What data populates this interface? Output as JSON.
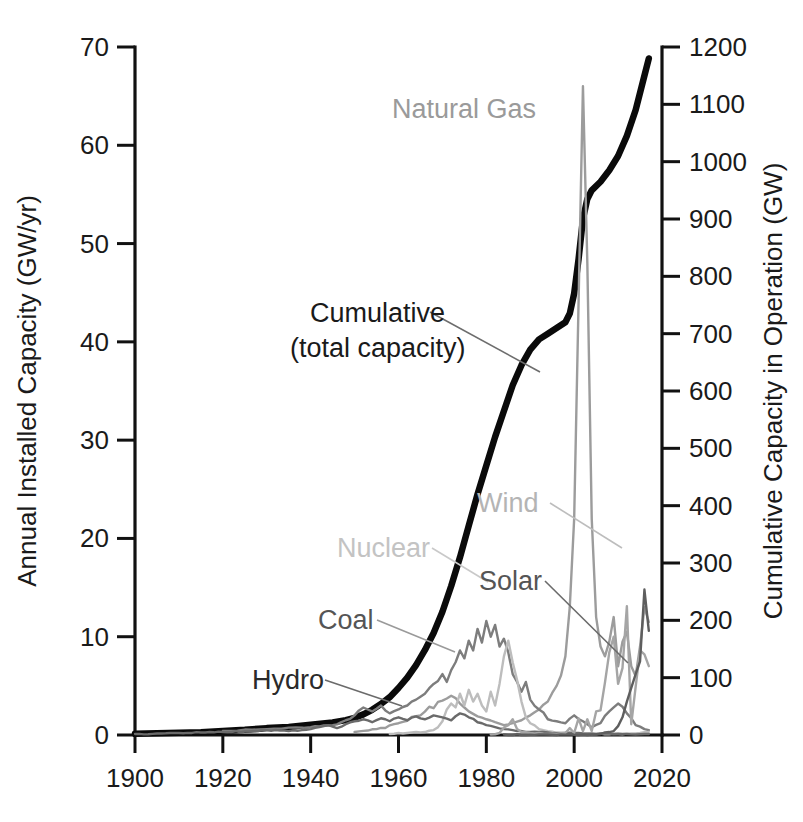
{
  "chart_data": {
    "type": "line",
    "title": "",
    "subtitle": "",
    "xlabel": "",
    "ylabel": "Annual Installed Capacity (GW/yr)",
    "y2label": "Cumulative Capacity in Operation (GW)",
    "xlim": [
      1900,
      2020
    ],
    "ylim": [
      0,
      70
    ],
    "y2lim": [
      0,
      1200
    ],
    "grid": false,
    "legend_position": "inline-annotations",
    "x_ticks": [
      1900,
      1920,
      1940,
      1960,
      1980,
      2000,
      2020
    ],
    "y_ticks": [
      0,
      10,
      20,
      30,
      40,
      50,
      60,
      70
    ],
    "y2_ticks": [
      0,
      100,
      200,
      300,
      400,
      500,
      600,
      700,
      800,
      900,
      1000,
      1100,
      1200
    ],
    "x_tick_labels": [
      "1900",
      "1920",
      "1940",
      "1960",
      "1980",
      "2000",
      "2020"
    ],
    "y_tick_labels": [
      "0",
      "10",
      "20",
      "30",
      "40",
      "50",
      "60",
      "70"
    ],
    "y2_tick_labels": [
      "0",
      "100",
      "200",
      "300",
      "400",
      "500",
      "600",
      "700",
      "800",
      "900",
      "1000",
      "1100",
      "1200"
    ],
    "annotations": [
      {
        "id": "natural-gas",
        "text": "Natural Gas",
        "color": "#9a9a9a",
        "x": 536,
        "y": 118,
        "anchor": "end"
      },
      {
        "id": "cumulative",
        "text": "Cumulative",
        "color": "#1a1a1a",
        "x": 310,
        "y": 322,
        "anchor": "start"
      },
      {
        "id": "cumulative-2",
        "text": "(total capacity)",
        "color": "#1a1a1a",
        "x": 290,
        "y": 357,
        "anchor": "start"
      },
      {
        "id": "wind",
        "text": "Wind",
        "color": "#b4b4b4",
        "x": 477,
        "y": 512,
        "anchor": "start"
      },
      {
        "id": "nuclear",
        "text": "Nuclear",
        "color": "#c3c3c3",
        "x": 337,
        "y": 557,
        "anchor": "start"
      },
      {
        "id": "solar",
        "text": "Solar",
        "color": "#555555",
        "x": 479,
        "y": 590,
        "anchor": "start"
      },
      {
        "id": "coal",
        "text": "Coal",
        "color": "#555555",
        "x": 318,
        "y": 629,
        "anchor": "start"
      },
      {
        "id": "hydro",
        "text": "Hydro",
        "color": "#2a2a2a",
        "x": 252,
        "y": 689,
        "anchor": "start"
      }
    ],
    "series": [
      {
        "name": "Cumulative (total capacity)",
        "axis": "right",
        "color": "#0a0a0a",
        "width": 6.5,
        "x": [
          1900,
          1905,
          1910,
          1915,
          1920,
          1925,
          1930,
          1935,
          1940,
          1945,
          1948,
          1950,
          1952,
          1954,
          1956,
          1958,
          1960,
          1962,
          1964,
          1966,
          1968,
          1970,
          1972,
          1974,
          1976,
          1978,
          1980,
          1982,
          1984,
          1986,
          1988,
          1990,
          1992,
          1994,
          1996,
          1998,
          1999,
          2000,
          2001,
          2002,
          2003,
          2004,
          2006,
          2008,
          2010,
          2012,
          2014,
          2016,
          2017
        ],
        "values": [
          2,
          3,
          4,
          5,
          7,
          9,
          12,
          14,
          18,
          22,
          26,
          30,
          36,
          44,
          54,
          66,
          82,
          100,
          122,
          148,
          178,
          215,
          260,
          310,
          365,
          420,
          470,
          520,
          565,
          610,
          645,
          672,
          690,
          700,
          710,
          720,
          735,
          770,
          830,
          900,
          935,
          950,
          965,
          985,
          1010,
          1045,
          1090,
          1150,
          1180
        ]
      },
      {
        "name": "Natural Gas",
        "axis": "left",
        "color": "#9c9c9c",
        "width": 2.4,
        "x": [
          1950,
          1955,
          1960,
          1965,
          1970,
          1972,
          1974,
          1976,
          1978,
          1980,
          1982,
          1984,
          1986,
          1988,
          1990,
          1992,
          1994,
          1996,
          1998,
          1999,
          2000,
          2001,
          2002,
          2003,
          2004,
          2005,
          2006,
          2007,
          2008,
          2009,
          2010,
          2011,
          2012,
          2013,
          2014,
          2015,
          2016,
          2017
        ],
        "values": [
          0.3,
          0.6,
          1.2,
          2.0,
          3.5,
          4.0,
          3.2,
          2.4,
          1.9,
          1.6,
          1.3,
          1.0,
          1.2,
          1.5,
          2.0,
          2.6,
          3.4,
          5.0,
          8.0,
          13.0,
          22.0,
          44.0,
          66.0,
          48.0,
          22.0,
          12.0,
          9.0,
          8.0,
          9.5,
          12.0,
          7.0,
          9.5,
          10.5,
          7.0,
          6.0,
          9.0,
          13.0,
          11.5
        ]
      },
      {
        "name": "Coal",
        "axis": "left",
        "color": "#7d7d7d",
        "width": 2.4,
        "x": [
          1920,
          1930,
          1940,
          1945,
          1948,
          1950,
          1952,
          1954,
          1956,
          1958,
          1960,
          1962,
          1964,
          1966,
          1968,
          1970,
          1971,
          1972,
          1973,
          1974,
          1975,
          1976,
          1977,
          1978,
          1979,
          1980,
          1981,
          1982,
          1983,
          1984,
          1985,
          1986,
          1987,
          1988,
          1989,
          1990,
          1992,
          1994,
          1996,
          1998,
          2000,
          2002,
          2004,
          2006,
          2008,
          2010,
          2012,
          2014,
          2016,
          2017
        ],
        "values": [
          0.4,
          0.6,
          0.8,
          1.0,
          1.5,
          2.0,
          2.8,
          2.4,
          3.0,
          2.2,
          2.6,
          3.0,
          3.6,
          4.2,
          5.2,
          6.2,
          5.4,
          6.6,
          7.4,
          8.6,
          7.8,
          9.6,
          8.6,
          10.8,
          9.4,
          11.6,
          10.0,
          11.2,
          9.0,
          9.8,
          8.4,
          6.2,
          5.4,
          4.4,
          5.4,
          3.6,
          2.6,
          1.6,
          1.4,
          1.2,
          2.0,
          1.4,
          0.8,
          1.2,
          2.4,
          3.2,
          2.2,
          1.0,
          0.6,
          0.5
        ]
      },
      {
        "name": "Nuclear",
        "axis": "left",
        "color": "#bdbdbd",
        "width": 2.4,
        "x": [
          1958,
          1960,
          1962,
          1964,
          1966,
          1968,
          1969,
          1970,
          1971,
          1972,
          1973,
          1974,
          1975,
          1976,
          1977,
          1978,
          1979,
          1980,
          1981,
          1982,
          1983,
          1984,
          1985,
          1986,
          1987,
          1988,
          1989,
          1990,
          1992,
          1994,
          1996,
          1998,
          2000,
          2005,
          2010,
          2015,
          2017
        ],
        "values": [
          0.1,
          0.2,
          0.2,
          0.3,
          0.3,
          0.5,
          0.8,
          1.4,
          2.6,
          3.2,
          2.8,
          4.2,
          3.0,
          4.6,
          3.4,
          4.2,
          3.0,
          2.4,
          4.4,
          3.0,
          5.2,
          8.0,
          9.6,
          7.4,
          5.6,
          3.4,
          1.8,
          1.2,
          0.6,
          0.4,
          0.2,
          0.2,
          0.1,
          0.1,
          0.1,
          0.2,
          0.3
        ]
      },
      {
        "name": "Hydro",
        "axis": "left",
        "color": "#6a6a6a",
        "width": 2.4,
        "x": [
          1900,
          1905,
          1910,
          1915,
          1920,
          1925,
          1930,
          1935,
          1940,
          1942,
          1944,
          1946,
          1948,
          1950,
          1952,
          1954,
          1956,
          1958,
          1960,
          1962,
          1964,
          1966,
          1968,
          1970,
          1972,
          1974,
          1976,
          1978,
          1980,
          1982,
          1984,
          1986,
          1988,
          1990,
          1992,
          1994,
          1996,
          1998,
          2000,
          2004,
          2008,
          2012,
          2016,
          2017
        ],
        "values": [
          0.1,
          0.15,
          0.2,
          0.25,
          0.3,
          0.35,
          0.5,
          0.4,
          0.6,
          0.8,
          1.0,
          0.7,
          1.1,
          1.4,
          1.6,
          1.3,
          1.7,
          1.4,
          1.8,
          1.5,
          1.9,
          1.6,
          2.0,
          1.8,
          1.5,
          2.2,
          1.8,
          1.3,
          1.0,
          0.8,
          0.6,
          0.5,
          0.4,
          0.3,
          0.3,
          0.25,
          0.2,
          0.2,
          0.2,
          0.15,
          0.15,
          0.1,
          0.1,
          0.1
        ]
      },
      {
        "name": "Wind",
        "axis": "left",
        "color": "#a5a5a5",
        "width": 2.4,
        "x": [
          1981,
          1983,
          1985,
          1986,
          1987,
          1988,
          1990,
          1992,
          1994,
          1996,
          1998,
          1999,
          2000,
          2001,
          2002,
          2003,
          2004,
          2005,
          2006,
          2007,
          2008,
          2009,
          2010,
          2011,
          2012,
          2013,
          2014,
          2015,
          2016,
          2017
        ],
        "values": [
          0.05,
          0.2,
          1.0,
          1.6,
          0.6,
          0.3,
          0.2,
          0.2,
          0.1,
          0.1,
          0.2,
          0.7,
          0.2,
          1.7,
          0.4,
          1.6,
          0.4,
          2.4,
          2.5,
          5.3,
          8.4,
          10.0,
          5.2,
          6.8,
          13.1,
          1.1,
          4.9,
          8.6,
          8.2,
          7.0
        ]
      },
      {
        "name": "Solar",
        "axis": "left",
        "color": "#5e5e5e",
        "width": 2.4,
        "x": [
          1984,
          1990,
          1995,
          2000,
          2004,
          2006,
          2008,
          2009,
          2010,
          2011,
          2012,
          2013,
          2014,
          2015,
          2016,
          2017
        ],
        "values": [
          0.05,
          0.02,
          0.02,
          0.02,
          0.05,
          0.1,
          0.3,
          0.4,
          0.9,
          1.8,
          3.4,
          4.8,
          6.2,
          7.5,
          14.8,
          10.6
        ]
      }
    ]
  },
  "axes": {
    "left": {
      "title": "Annual Installed Capacity (GW/yr)",
      "labels": [
        "70",
        "60",
        "50",
        "40",
        "30",
        "20",
        "10",
        "0"
      ]
    },
    "right": {
      "title": "Cumulative Capacity in Operation (GW)",
      "labels": [
        "1200",
        "1100",
        "1000",
        "900",
        "800",
        "700",
        "600",
        "500",
        "400",
        "300",
        "200",
        "100",
        "0"
      ]
    },
    "bottom": {
      "labels": [
        "1900",
        "1920",
        "1940",
        "1960",
        "1980",
        "2000",
        "2020"
      ]
    }
  },
  "annotations": {
    "natural_gas": "Natural Gas",
    "cumulative_line1": "Cumulative",
    "cumulative_line2": "(total capacity)",
    "wind": "Wind",
    "nuclear": "Nuclear",
    "solar": "Solar",
    "coal": "Coal",
    "hydro": "Hydro"
  },
  "colors": {
    "cumulative": "#0a0a0a",
    "natural_gas": "#9c9c9c",
    "coal": "#7d7d7d",
    "nuclear": "#bdbdbd",
    "hydro": "#6a6a6a",
    "wind": "#a5a5a5",
    "solar": "#5e5e5e",
    "axis": "#111111"
  }
}
